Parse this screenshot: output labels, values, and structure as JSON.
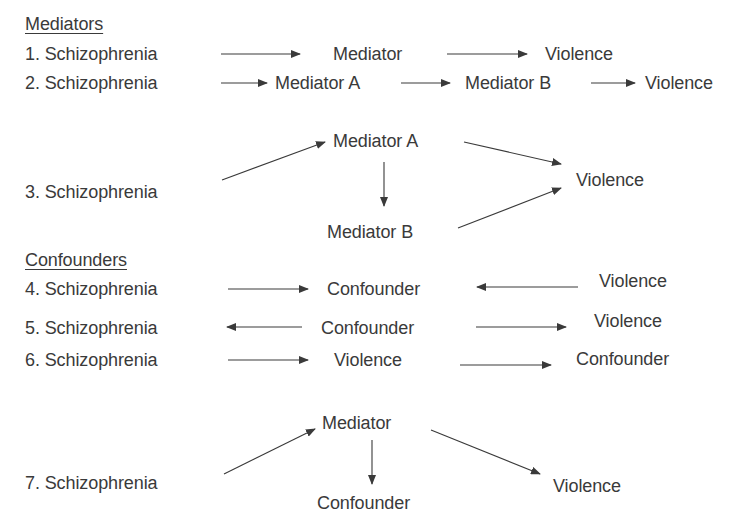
{
  "colors": {
    "text": "#3a3a3a",
    "background": "#ffffff"
  },
  "sections": {
    "mediators": {
      "title": "Mediators"
    },
    "confounders": {
      "title": "Confounders"
    }
  },
  "models": [
    {
      "number": "1.",
      "exposure": "Schizophrenia",
      "nodes": [
        "Mediator",
        "Violence"
      ],
      "edges": [
        [
          "Schizophrenia",
          "Mediator"
        ],
        [
          "Mediator",
          "Violence"
        ]
      ]
    },
    {
      "number": "2.",
      "exposure": "Schizophrenia",
      "nodes": [
        "Mediator A",
        "Mediator B",
        "Violence"
      ],
      "edges": [
        [
          "Schizophrenia",
          "Mediator A"
        ],
        [
          "Mediator A",
          "Mediator B"
        ],
        [
          "Mediator B",
          "Violence"
        ]
      ]
    },
    {
      "number": "3.",
      "exposure": "Schizophrenia",
      "nodes": [
        "Mediator A",
        "Mediator B",
        "Violence"
      ],
      "edges": [
        [
          "Schizophrenia",
          "Mediator A"
        ],
        [
          "Mediator A",
          "Mediator B"
        ],
        [
          "Mediator A",
          "Violence"
        ],
        [
          "Mediator B",
          "Violence"
        ]
      ]
    },
    {
      "number": "4.",
      "exposure": "Schizophrenia",
      "nodes": [
        "Confounder",
        "Violence"
      ],
      "edges": [
        [
          "Schizophrenia",
          "Confounder"
        ],
        [
          "Violence",
          "Confounder"
        ]
      ]
    },
    {
      "number": "5.",
      "exposure": "Schizophrenia",
      "nodes": [
        "Confounder",
        "Violence"
      ],
      "edges": [
        [
          "Confounder",
          "Schizophrenia"
        ],
        [
          "Confounder",
          "Violence"
        ]
      ]
    },
    {
      "number": "6.",
      "exposure": "Schizophrenia",
      "nodes": [
        "Violence",
        "Confounder"
      ],
      "edges": [
        [
          "Schizophrenia",
          "Violence"
        ],
        [
          "Violence",
          "Confounder"
        ]
      ]
    },
    {
      "number": "7.",
      "exposure": "Schizophrenia",
      "nodes": [
        "Mediator",
        "Confounder",
        "Violence"
      ],
      "edges": [
        [
          "Schizophrenia",
          "Mediator"
        ],
        [
          "Mediator",
          "Confounder"
        ],
        [
          "Mediator",
          "Violence"
        ]
      ]
    }
  ],
  "labels": {
    "m1_1": "1.  Schizophrenia",
    "m1_2": "Mediator",
    "m1_3": "Violence",
    "m2_1": "2.  Schizophrenia",
    "m2_2": "Mediator A",
    "m2_3": "Mediator B",
    "m2_4": "Violence",
    "m3_1": "3.  Schizophrenia",
    "m3_2": "Mediator A",
    "m3_3": "Mediator B",
    "m3_4": "Violence",
    "m4_1": "4.   Schizophrenia",
    "m4_2": "Confounder",
    "m4_3": "Violence",
    "m5_1": "5.  Schizophrenia",
    "m5_2": "Confounder",
    "m5_3": "Violence",
    "m6_1": "6.  Schizophrenia",
    "m6_2": "Violence",
    "m6_3": "Confounder",
    "m7_1": "7.  Schizophrenia",
    "m7_2": "Mediator",
    "m7_3": "Confounder",
    "m7_4": "Violence"
  }
}
